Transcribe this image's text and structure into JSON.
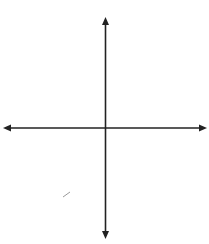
{
  "diagram": {
    "type": "coordinate-plane-transformation",
    "axes": {
      "x_label": "",
      "y_label": "y",
      "x_range": [
        -10,
        10
      ],
      "y_range": [
        -10,
        10
      ],
      "grid": true
    },
    "figures": [
      {
        "name": "MATH",
        "vertices": [
          {
            "label": "M",
            "x": 2,
            "y": 4
          },
          {
            "label": "A",
            "x": 4,
            "y": 4
          },
          {
            "label": "T",
            "x": 4,
            "y": 2
          },
          {
            "label": "H",
            "x": 0,
            "y": 0
          }
        ]
      },
      {
        "name": "M''A''T''H''",
        "vertices": [
          {
            "label": "H''",
            "x": -1,
            "y": 1
          },
          {
            "label": "T''",
            "x": -5,
            "y": -1
          },
          {
            "label": "A''",
            "x": -5,
            "y": -3
          },
          {
            "label": "M''",
            "x": -3,
            "y": -3
          }
        ]
      }
    ],
    "colors": {
      "grid": "#8a8a8a",
      "axis": "#222222",
      "shape": "#1a1a1a",
      "background": "#ffffff"
    }
  }
}
